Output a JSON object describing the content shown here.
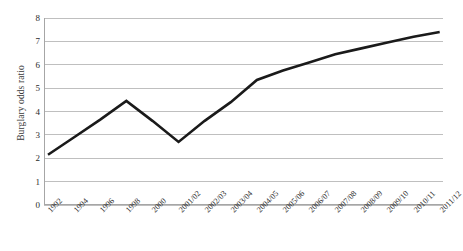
{
  "chart_data": {
    "type": "line",
    "title": "",
    "xlabel": "",
    "ylabel": "Burglary odds ratio",
    "ylim": [
      0,
      8
    ],
    "yticks": [
      "0",
      "1",
      "2",
      "3",
      "4",
      "5",
      "6",
      "7",
      "8"
    ],
    "grid": true,
    "legend": "none",
    "line_color": "#1a1a1a",
    "grid_color": "#bfbfbf",
    "axis_color": "#a6a6a6",
    "background_color": "#ffffff",
    "categories": [
      "1992",
      "1994",
      "1996",
      "1998",
      "2000",
      "2001/02",
      "2002/03",
      "2003/04",
      "2004/05",
      "2005/06",
      "2006/07",
      "2007/08",
      "2008/09",
      "2009/10",
      "2010/11",
      "2011/12"
    ],
    "values": [
      2.15,
      2.9,
      3.65,
      4.45,
      3.6,
      2.7,
      3.6,
      4.4,
      5.35,
      5.75,
      6.1,
      6.45,
      6.7,
      6.95,
      7.2,
      7.4
    ],
    "series": [
      {
        "name": "Burglary odds ratio",
        "values": [
          2.15,
          2.9,
          3.65,
          4.45,
          3.6,
          2.7,
          3.6,
          4.4,
          5.35,
          5.75,
          6.1,
          6.45,
          6.7,
          6.95,
          7.2,
          7.4
        ]
      }
    ],
    "vertices": [
      {
        "label": "1992",
        "value": 2.15
      },
      {
        "label": "1998",
        "value": 4.45
      },
      {
        "label": "2001/02",
        "value": 2.7
      },
      {
        "label": "2005/06",
        "value": 5.35
      },
      {
        "label": "2011/12",
        "value": 7.4
      }
    ]
  }
}
